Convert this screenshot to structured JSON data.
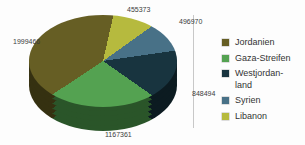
{
  "chart_data": {
    "type": "pie",
    "style": "3d",
    "title": "",
    "legend_position": "right",
    "direction": "counterclockwise-from-top",
    "rotation_deg": 8,
    "categories": [
      "Jordanien",
      "Gaza-Streifen",
      "Westjordanland",
      "Syrien",
      "Libanon"
    ],
    "values": [
      1999466,
      1167361,
      848494,
      496970,
      455373
    ],
    "slices": [
      {
        "label": "Jordanien",
        "legend_label": "Jordanien",
        "value": 1999466,
        "value_label": "1999466",
        "color": "#665e24"
      },
      {
        "label": "Gaza-Streifen",
        "legend_label": "Gaza-Streifen",
        "value": 1167361,
        "value_label": "1167361",
        "color": "#54a251"
      },
      {
        "label": "Westjordanland",
        "legend_label": "Westjordan-land",
        "value": 848494,
        "value_label": "848494",
        "color": "#18343f"
      },
      {
        "label": "Syrien",
        "legend_label": "Syrien",
        "value": 496970,
        "value_label": "496970",
        "color": "#487187"
      },
      {
        "label": "Libanon",
        "legend_label": "Libanon",
        "value": 455373,
        "value_label": "455373",
        "color": "#b6ba3e"
      }
    ]
  }
}
